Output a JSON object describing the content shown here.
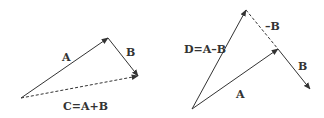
{
  "diagram": {
    "line_color": "#333333",
    "left": {
      "labels": {
        "a": "A",
        "b": "B",
        "c": "C=A+B"
      },
      "vectors": [
        {
          "name": "A",
          "style": "solid"
        },
        {
          "name": "B",
          "style": "solid"
        },
        {
          "name": "C=A+B",
          "style": "dashed"
        }
      ]
    },
    "right": {
      "labels": {
        "d": "D=A–B",
        "a": "A",
        "b": "B",
        "neg_b": "–B"
      },
      "vectors": [
        {
          "name": "D=A–B",
          "style": "solid"
        },
        {
          "name": "A",
          "style": "solid"
        },
        {
          "name": "B",
          "style": "solid"
        },
        {
          "name": "–B",
          "style": "dashed"
        }
      ]
    }
  }
}
